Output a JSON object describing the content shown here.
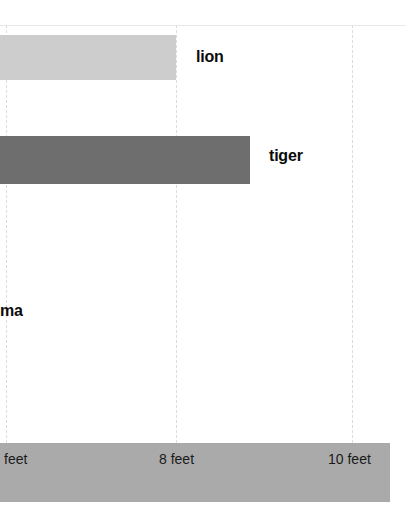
{
  "chart_data": {
    "type": "bar",
    "orientation": "horizontal",
    "title": "",
    "xlabel": "",
    "ylabel": "",
    "categories": [
      "lion",
      "tiger",
      "ma"
    ],
    "values": [
      8,
      9,
      null
    ],
    "value_unit": "feet",
    "xlim": [
      6,
      10
    ],
    "axis_ticks": [
      {
        "value": 6,
        "label": "feet",
        "x": 6,
        "truncated": true
      },
      {
        "value": 8,
        "label": "8 feet",
        "x": 176,
        "truncated": false
      },
      {
        "value": 10,
        "label": "10 feet",
        "x": 352,
        "truncated": false
      }
    ],
    "grid": true,
    "grid_style": "dashed-vertical",
    "legend": "none",
    "bars": [
      {
        "category": "lion",
        "label": "lion",
        "value": 8,
        "color": "#cdcdcd",
        "top": 35,
        "height": 45,
        "width": 176,
        "label_left": 196,
        "label_top": 48,
        "clipped_left": true
      },
      {
        "category": "tiger",
        "label": "tiger",
        "value": 9,
        "color": "#6e6e6e",
        "top": 136,
        "height": 48,
        "width": 250,
        "label_left": 269,
        "label_top": 147,
        "clipped_left": true
      }
    ],
    "orphan_labels": [
      {
        "label": "ma",
        "left": 0,
        "top": 302,
        "truncated": true
      }
    ]
  },
  "colors": {
    "background": "#ffffff",
    "lion_bar": "#cdcdcd",
    "tiger_bar": "#6e6e6e",
    "axis_band": "#aaaaaa",
    "gridline": "#dcdcdc",
    "top_rule": "#e8e8e8",
    "text": "#0a0a0a"
  },
  "gridlines": [
    {
      "name": "6-feet",
      "x": 6
    },
    {
      "name": "8-feet",
      "x": 176
    },
    {
      "name": "10-feet",
      "x": 352
    }
  ],
  "labels": {
    "lion": "lion",
    "tiger": "tiger",
    "puma_truncated": "ma"
  },
  "ticks": {
    "left": "feet",
    "middle": "8 feet",
    "right": "10 feet"
  }
}
